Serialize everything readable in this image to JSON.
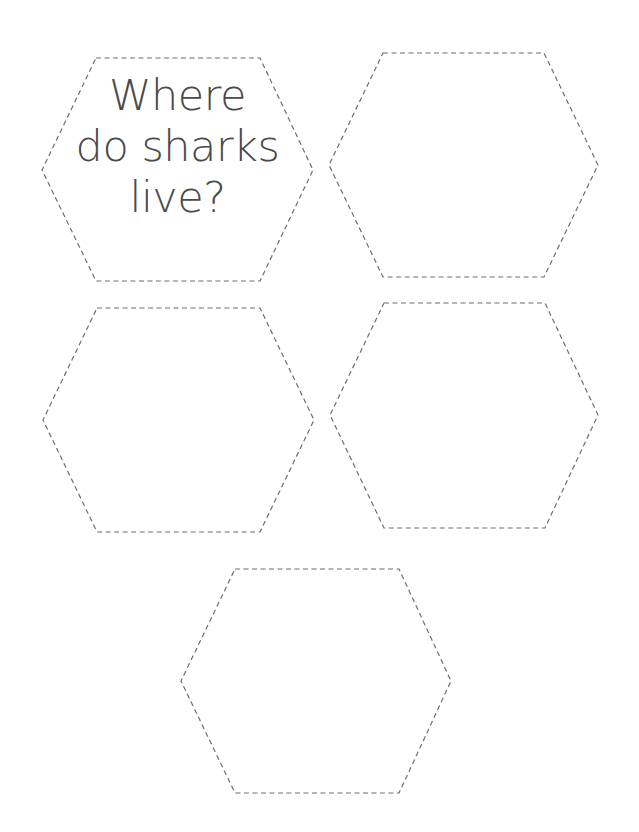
{
  "worksheet": {
    "stroke_color": "#6e6e6e",
    "text_color": "#4a4a4a",
    "hexagons": [
      {
        "id": "hex-1",
        "points": "96,58 260,58 313,170 260,281 96,281 42,170",
        "text_lines": [
          "Where",
          "do sharks",
          "live?"
        ]
      },
      {
        "id": "hex-2",
        "points": "383,53 544,53 598,165 544,277 383,277 329,165",
        "text_lines": []
      },
      {
        "id": "hex-3",
        "points": "97,308 260,308 314,420 260,532 97,532 43,420",
        "text_lines": []
      },
      {
        "id": "hex-4",
        "points": "384,303 545,303 598,415 545,528 384,528 330,415",
        "text_lines": []
      },
      {
        "id": "hex-5",
        "points": "235,569 399,569 451,681 399,793 235,793 181,681",
        "text_lines": []
      }
    ]
  }
}
